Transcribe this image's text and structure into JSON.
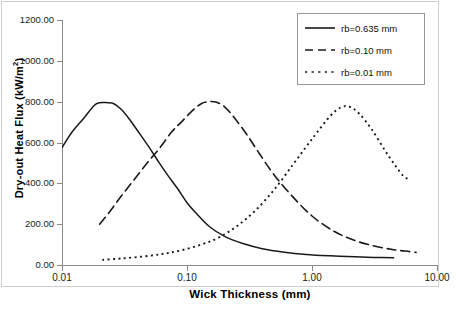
{
  "chart_data": {
    "type": "line",
    "title": "",
    "xlabel": "Wick Thickness (mm)",
    "ylabel": "Dry-out Heat Flux (kW/m²)",
    "ylabel_base": "Dry-out Heat Flux (kW/m",
    "ylabel_sup": "2",
    "ylabel_tail": ")",
    "xscale": "log",
    "yscale": "linear",
    "xlim": [
      0.01,
      10.0
    ],
    "ylim": [
      0.0,
      1200.0
    ],
    "grid": false,
    "legend_position": "top-right",
    "xticks": [
      0.01,
      0.1,
      1.0,
      10.0
    ],
    "xtick_labels": [
      "0.01",
      "0.10",
      "1.00",
      "10.00"
    ],
    "yticks": [
      0,
      200,
      400,
      600,
      800,
      1000,
      1200
    ],
    "ytick_labels": [
      "0.00",
      "200.00",
      "400.00",
      "600.00",
      "800.00",
      "1000.00",
      "1200.00"
    ],
    "series": [
      {
        "name": "rb=0.635 mm",
        "style": "solid",
        "color": "#1a1a1a",
        "x": [
          0.01,
          0.012,
          0.015,
          0.018,
          0.02,
          0.023,
          0.026,
          0.03,
          0.035,
          0.04,
          0.05,
          0.06,
          0.07,
          0.085,
          0.1,
          0.12,
          0.15,
          0.2,
          0.28,
          0.4,
          0.6,
          0.9,
          1.4,
          2.2,
          3.2,
          4.5
        ],
        "y": [
          575,
          650,
          720,
          780,
          795,
          795,
          790,
          760,
          710,
          660,
          575,
          500,
          440,
          370,
          305,
          250,
          190,
          140,
          105,
          80,
          63,
          52,
          45,
          40,
          37,
          35
        ]
      },
      {
        "name": "rb=0.10 mm",
        "style": "dashed",
        "color": "#1a1a1a",
        "x": [
          0.02,
          0.024,
          0.03,
          0.038,
          0.048,
          0.06,
          0.075,
          0.09,
          0.11,
          0.13,
          0.15,
          0.17,
          0.2,
          0.24,
          0.3,
          0.38,
          0.5,
          0.7,
          1.0,
          1.5,
          2.2,
          3.2,
          4.5,
          6.0,
          6.8
        ],
        "y": [
          200,
          260,
          340,
          420,
          500,
          570,
          650,
          700,
          755,
          790,
          800,
          798,
          775,
          720,
          640,
          545,
          440,
          335,
          240,
          165,
          120,
          92,
          75,
          66,
          62
        ]
      },
      {
        "name": "rb=0.01 mm",
        "style": "dotted",
        "color": "#1a1a1a",
        "x": [
          0.021,
          0.03,
          0.045,
          0.065,
          0.09,
          0.13,
          0.18,
          0.25,
          0.35,
          0.5,
          0.7,
          0.9,
          1.1,
          1.4,
          1.7,
          2.0,
          2.4,
          3.0,
          3.8,
          4.6,
          5.4,
          6.0
        ],
        "y": [
          25,
          32,
          42,
          55,
          72,
          100,
          135,
          190,
          265,
          370,
          490,
          580,
          650,
          730,
          772,
          775,
          740,
          665,
          565,
          490,
          435,
          420
        ]
      }
    ]
  },
  "legend": {
    "items": [
      {
        "label": "rb=0.635 mm",
        "style": "solid"
      },
      {
        "label": "rb=0.10 mm",
        "style": "dashed"
      },
      {
        "label": "rb=0.01 mm",
        "style": "dotted"
      }
    ]
  }
}
